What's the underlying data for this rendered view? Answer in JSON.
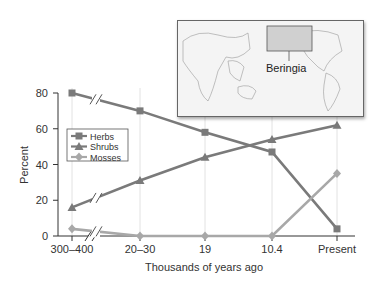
{
  "chart_data": {
    "type": "line",
    "title": "",
    "xlabel": "Thousands of years ago",
    "ylabel": "Percent",
    "categories": [
      "300–400",
      "20–30",
      "19",
      "10.4",
      "Present"
    ],
    "ylim": [
      0,
      80
    ],
    "yticks": [
      0,
      20,
      40,
      60,
      80
    ],
    "grid": "vertical lines at categories",
    "axis_break": "between 300–400 and 20–30",
    "legend_position": "upper left inside plot",
    "series": [
      {
        "name": "Herbs",
        "marker": "square",
        "color": "#7a7a7a",
        "values": [
          80,
          70,
          58,
          47,
          4
        ]
      },
      {
        "name": "Shrubs",
        "marker": "triangle",
        "color": "#7a7a7a",
        "values": [
          16,
          31,
          44,
          54,
          62
        ]
      },
      {
        "name": "Mosses",
        "marker": "diamond",
        "color": "#a8a8a8",
        "values": [
          4,
          0,
          0,
          0,
          35
        ]
      }
    ]
  },
  "inset_map": {
    "label": "Beringia"
  },
  "legend": {
    "herbs": "Herbs",
    "shrubs": "Shrubs",
    "mosses": "Mosses"
  }
}
